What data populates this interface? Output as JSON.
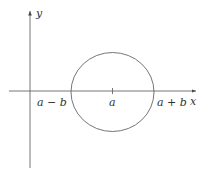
{
  "diagram": {
    "axes": {
      "x_label": "x",
      "y_label": "y",
      "color": "#555555"
    },
    "circle": {
      "center_label": "a",
      "left_label": "a − b",
      "right_label": "a + b",
      "color": "#555555"
    }
  }
}
